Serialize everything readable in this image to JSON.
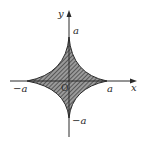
{
  "diagram": {
    "type": "astroid",
    "fill": "hatched",
    "colors": {
      "stroke": "#2a2a2a",
      "hatch": "#3a3a3a",
      "background": "#ffffff"
    },
    "axes": {
      "x_label": "x",
      "y_label": "y",
      "origin_label": "O"
    },
    "ticks": {
      "x_positive": "a",
      "x_negative": "−a",
      "y_positive": "a",
      "y_negative": "−a"
    }
  }
}
